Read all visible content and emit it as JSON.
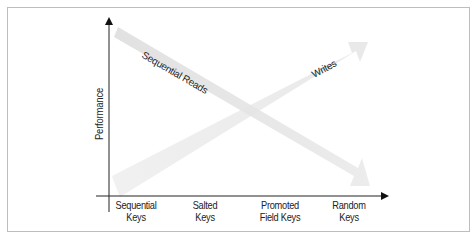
{
  "diagram": {
    "y_axis": {
      "label": "Performance"
    },
    "x_axis": {
      "categories": [
        {
          "line1": "Sequential",
          "line2": "Keys"
        },
        {
          "line1": "Salted",
          "line2": "Keys"
        },
        {
          "line1": "Promoted",
          "line2": "Field Keys"
        },
        {
          "line1": "Random",
          "line2": "Keys"
        }
      ]
    },
    "trends": [
      {
        "name": "Sequential Reads",
        "direction": "decreasing"
      },
      {
        "name": "Writes",
        "direction": "increasing"
      }
    ],
    "colors": {
      "frame": "#bdbdbd",
      "axis": "#222222",
      "trend_arrow": "#e6e6e6"
    }
  }
}
